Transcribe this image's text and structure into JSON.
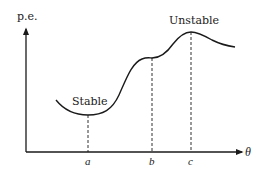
{
  "diagram": {
    "y_axis_label": "p.e.",
    "x_axis_label": "θ",
    "points": [
      {
        "id": "a",
        "label": "a",
        "annotation": "Stable"
      },
      {
        "id": "b",
        "label": "b",
        "annotation": ""
      },
      {
        "id": "c",
        "label": "c",
        "annotation": "Unstable"
      }
    ],
    "stable_label": "Stable",
    "unstable_label": "Unstable",
    "colors": {
      "line": "#1a1a1a",
      "background": "#ffffff"
    }
  }
}
